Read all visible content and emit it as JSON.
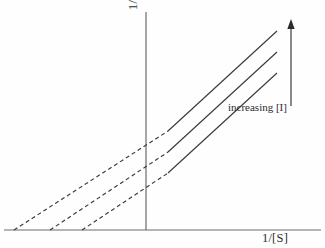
{
  "figure": {
    "type": "lineweaver-burk-plot",
    "background_color": "#fefefe",
    "line_color": "#3a3a3a",
    "axis_color": "#6b6b6b",
    "y_axis_label": "1/V",
    "y_axis_label_prefix": "1/",
    "y_axis_label_symbol": "V",
    "x_axis_label": "1/[S]",
    "annotation": "increasing [I]",
    "arrow": {
      "name": "increasing-inhibitor-arrow",
      "direction": "up",
      "x": 291,
      "y_tail": 106,
      "y_head": 19
    },
    "axes": {
      "y_axis": {
        "x": 146,
        "y_top": 12,
        "y_bottom": 230
      },
      "x_axis": {
        "y": 230,
        "x_left": 4,
        "x_right": 321
      }
    }
  },
  "chart_data": {
    "type": "line",
    "title": "",
    "xlabel": "1/[S]",
    "ylabel": "1/V",
    "grid": false,
    "legend": null,
    "annotations": [
      {
        "text": "increasing [I]",
        "x": 228,
        "y": 101
      }
    ],
    "series": [
      {
        "name": "line-1-lowest-inhibitor",
        "solid": {
          "x1": 168,
          "y1": 173,
          "x2": 277,
          "y2": 73
        },
        "dashed": {
          "x1": 82,
          "y1": 230,
          "x2": 168,
          "y2": 173
        },
        "x_intercept_px": 82,
        "y_intercept_px": 173,
        "slope": 0.757
      },
      {
        "name": "line-2-medium-inhibitor",
        "solid": {
          "x1": 168,
          "y1": 152,
          "x2": 277,
          "y2": 52
        },
        "dashed": {
          "x1": 50,
          "y1": 230,
          "x2": 168,
          "y2": 152
        },
        "x_intercept_px": 50,
        "y_intercept_px": 152,
        "slope": 0.757
      },
      {
        "name": "line-3-highest-inhibitor",
        "solid": {
          "x1": 168,
          "y1": 131,
          "x2": 277,
          "y2": 31
        },
        "dashed": {
          "x1": 14,
          "y1": 230,
          "x2": 168,
          "y2": 131
        },
        "x_intercept_px": 14,
        "y_intercept_px": 131,
        "slope": 0.757
      }
    ]
  }
}
